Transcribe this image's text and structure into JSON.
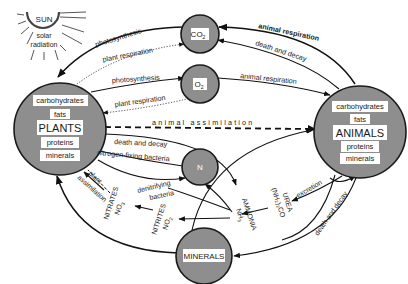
{
  "diagram": {
    "type": "cycle-diagram",
    "sun": {
      "title": "SUN",
      "subtitle_line1": "solar",
      "subtitle_line2": "radiation"
    },
    "pools": {
      "co2": {
        "label": "CO",
        "sub": "2"
      },
      "o2": {
        "label": "O",
        "sub": "2"
      },
      "n": {
        "label": "N"
      },
      "minerals": {
        "label": "MINERALS"
      },
      "plants": {
        "title": "PLANTS",
        "items": [
          "carbohydrates",
          "fats",
          "proteins",
          "minerals"
        ]
      },
      "animals": {
        "title": "ANIMALS",
        "items": [
          "carbohydrates",
          "fats",
          "proteins",
          "minerals"
        ]
      }
    },
    "compounds": {
      "nitrates": {
        "name": "NITRATES",
        "formula": "NO",
        "sub": "3"
      },
      "nitrites": {
        "name": "NITRITES",
        "formula": "NO",
        "sub": "2"
      },
      "ammonia": {
        "name": "AMMONIA",
        "formula": "NH",
        "sub": "3"
      },
      "urea": {
        "name": "UREA",
        "formula": "(NH₂)₂CO"
      }
    },
    "flows": {
      "co2_to_plants": "photosynthesis",
      "plants_to_co2": "plant respiration",
      "plants_to_o2": "photosynthesis",
      "o2_to_plants": "plant respiration",
      "animals_to_co2_resp": "animal respiration",
      "animals_to_co2_decay": "death and decay",
      "o2_to_animals": "animal respiration",
      "plants_to_animals": "animal assimilation",
      "plants_to_ammonia": "death and decay",
      "n_to_plants": "nitrogen-fixing bacteria",
      "denitrifying_line1": "denitrifying",
      "denitrifying_line2": "bacteria",
      "plant_assim_line1": "plant",
      "plant_assim_line2": "assimilation",
      "animals_to_urea": "excretion",
      "animals_to_minerals": "death and decay"
    }
  }
}
